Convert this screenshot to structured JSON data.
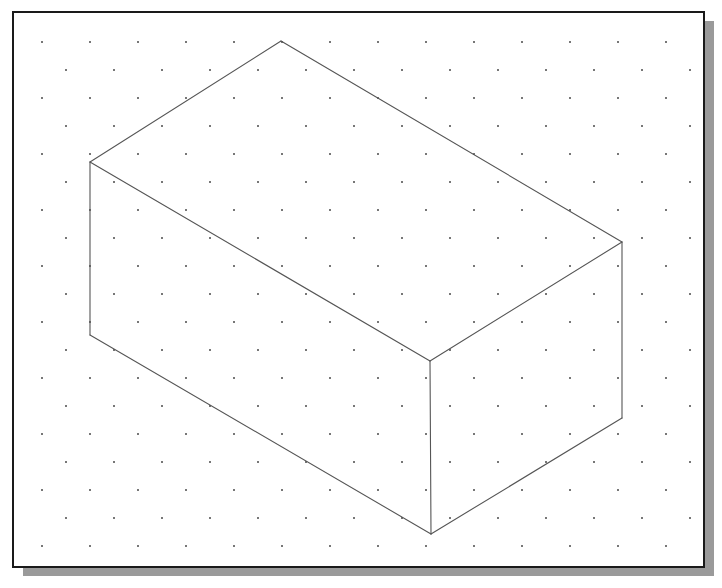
{
  "figure": {
    "title": "Isometric drawing of a rectangular box on isometric dot grid paper",
    "kind": "isometric-line-drawing",
    "canvas": {
      "width": 722,
      "height": 588
    },
    "colors": {
      "page_background": "#ffffff",
      "panel_background": "#ffffff",
      "panel_border": "#1a1a1a",
      "panel_shadow": "#9a9a9a",
      "grid_dot": "#4a4a4a",
      "figure_stroke": "#555555"
    },
    "panel": {
      "x": 13,
      "y": 12,
      "width": 691,
      "height": 555,
      "border_width": 2,
      "shadow": {
        "offset_x": 10,
        "offset_y": 9,
        "width": 691,
        "height": 555
      }
    },
    "grid": {
      "label": "isometric dot grid",
      "dot_radius": 1.0,
      "row_spacing": 28,
      "column_spacing": 48,
      "row_offset": 24,
      "origin_x": 42,
      "origin_y": 42,
      "rows": 19,
      "columns": 14
    },
    "shape": {
      "name": "rectangular-box",
      "label": "Rectangular box (cuboid)",
      "stroke_width": 1.1,
      "fill": "none",
      "vertices": {
        "top_back": {
          "x": 281,
          "y": 41,
          "label": "back top corner"
        },
        "top_left": {
          "x": 90,
          "y": 162,
          "label": "left top corner"
        },
        "top_right": {
          "x": 622,
          "y": 242,
          "label": "right top corner"
        },
        "top_front": {
          "x": 430,
          "y": 361,
          "label": "front top corner"
        },
        "bottom_left": {
          "x": 90,
          "y": 335,
          "label": "left bottom corner"
        },
        "bottom_right": {
          "x": 622,
          "y": 418,
          "label": "right bottom corner"
        },
        "bottom_front": {
          "x": 431,
          "y": 534,
          "label": "front bottom corner"
        }
      },
      "faces": [
        {
          "name": "top-face",
          "label": "Top face",
          "points": "281,41 622,242 430,361 90,162"
        },
        {
          "name": "left-face",
          "label": "Left front face",
          "points": "90,162 430,361 431,534 90,335"
        },
        {
          "name": "right-face",
          "label": "Right front face",
          "points": "430,361 622,242 622,418 431,534"
        }
      ],
      "edges": [
        {
          "name": "edge-top-back-to-top-right",
          "x1": 281,
          "y1": 41,
          "x2": 622,
          "y2": 242
        },
        {
          "name": "edge-top-back-to-top-left",
          "x1": 281,
          "y1": 41,
          "x2": 90,
          "y2": 162
        },
        {
          "name": "edge-top-left-to-top-front",
          "x1": 90,
          "y1": 162,
          "x2": 430,
          "y2": 361
        },
        {
          "name": "edge-top-right-to-top-front",
          "x1": 622,
          "y1": 242,
          "x2": 430,
          "y2": 361
        },
        {
          "name": "edge-top-left-vertical",
          "x1": 90,
          "y1": 162,
          "x2": 90,
          "y2": 335
        },
        {
          "name": "edge-top-right-vertical",
          "x1": 622,
          "y1": 242,
          "x2": 622,
          "y2": 418
        },
        {
          "name": "edge-top-front-vertical",
          "x1": 430,
          "y1": 361,
          "x2": 431,
          "y2": 534
        },
        {
          "name": "edge-bottom-left-to-front",
          "x1": 90,
          "y1": 335,
          "x2": 431,
          "y2": 534
        },
        {
          "name": "edge-bottom-right-to-front",
          "x1": 622,
          "y1": 418,
          "x2": 431,
          "y2": 534
        }
      ]
    }
  }
}
